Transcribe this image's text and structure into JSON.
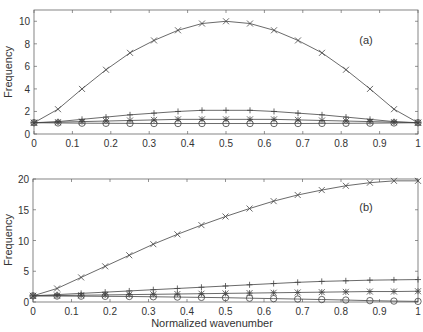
{
  "chart_data": [
    {
      "type": "line",
      "panel_label": "(a)",
      "xlabel": "",
      "ylabel": "Frequency",
      "xlim": [
        0,
        1
      ],
      "ylim": [
        0,
        11
      ],
      "xticks": [
        0,
        0.1,
        0.2,
        0.3,
        0.4,
        0.5,
        0.6,
        0.7,
        0.8,
        0.9,
        1
      ],
      "xtick_labels": [
        "0",
        "0.1",
        "0.2",
        "0.3",
        "0.4",
        "0.5",
        "0.6",
        "0.7",
        "0.8",
        "0.9",
        "1"
      ],
      "yticks": [
        0,
        2,
        4,
        6,
        8,
        10
      ],
      "ytick_labels": [
        "0",
        "2",
        "4",
        "6",
        "8",
        "10"
      ],
      "grid": false,
      "legend": "none",
      "x": [
        0,
        0.0625,
        0.125,
        0.1875,
        0.25,
        0.3125,
        0.375,
        0.4375,
        0.5,
        0.5625,
        0.625,
        0.6875,
        0.75,
        0.8125,
        0.875,
        0.9375,
        1.0
      ],
      "series": [
        {
          "name": "x-marker",
          "marker": "x",
          "values": [
            1.0,
            2.2,
            4.0,
            5.7,
            7.2,
            8.3,
            9.2,
            9.8,
            10.0,
            9.8,
            9.2,
            8.3,
            7.2,
            5.7,
            4.0,
            2.2,
            1.0
          ]
        },
        {
          "name": "plus-marker",
          "marker": "+",
          "values": [
            1.0,
            1.1,
            1.3,
            1.5,
            1.7,
            1.85,
            2.0,
            2.1,
            2.1,
            2.1,
            2.0,
            1.85,
            1.7,
            1.5,
            1.3,
            1.1,
            1.0
          ]
        },
        {
          "name": "star-marker",
          "marker": "*",
          "values": [
            1.0,
            1.05,
            1.1,
            1.15,
            1.2,
            1.25,
            1.3,
            1.3,
            1.3,
            1.3,
            1.3,
            1.25,
            1.2,
            1.15,
            1.1,
            1.05,
            1.0
          ]
        },
        {
          "name": "circle-marker",
          "marker": "o",
          "values": [
            1.0,
            0.98,
            0.96,
            0.95,
            0.94,
            0.93,
            0.93,
            0.93,
            0.93,
            0.93,
            0.93,
            0.93,
            0.94,
            0.95,
            0.96,
            0.98,
            1.0
          ]
        }
      ]
    },
    {
      "type": "line",
      "panel_label": "(b)",
      "xlabel": "Normalized wavenumber",
      "ylabel": "Frequency",
      "xlim": [
        0,
        1
      ],
      "ylim": [
        0,
        20
      ],
      "xticks": [
        0,
        0.1,
        0.2,
        0.3,
        0.4,
        0.5,
        0.6,
        0.7,
        0.8,
        0.9,
        1
      ],
      "xtick_labels": [
        "0",
        "0.1",
        "0.2",
        "0.3",
        "0.4",
        "0.5",
        "0.6",
        "0.7",
        "0.8",
        "0.9",
        "1"
      ],
      "yticks": [
        0,
        5,
        10,
        15,
        20
      ],
      "ytick_labels": [
        "0",
        "5",
        "10",
        "15",
        "20"
      ],
      "grid": false,
      "legend": "none",
      "x": [
        0,
        0.0625,
        0.125,
        0.1875,
        0.25,
        0.3125,
        0.375,
        0.4375,
        0.5,
        0.5625,
        0.625,
        0.6875,
        0.75,
        0.8125,
        0.875,
        0.9375,
        1.0
      ],
      "series": [
        {
          "name": "x-marker",
          "marker": "x",
          "values": [
            1.0,
            2.2,
            4.0,
            5.8,
            7.6,
            9.4,
            11.0,
            12.5,
            13.9,
            15.2,
            16.4,
            17.4,
            18.2,
            18.9,
            19.4,
            19.7,
            19.7
          ]
        },
        {
          "name": "plus-marker",
          "marker": "+",
          "values": [
            1.0,
            1.2,
            1.4,
            1.6,
            1.8,
            2.0,
            2.2,
            2.4,
            2.6,
            2.8,
            3.0,
            3.2,
            3.35,
            3.45,
            3.55,
            3.6,
            3.65
          ]
        },
        {
          "name": "star-marker",
          "marker": "*",
          "values": [
            1.0,
            1.05,
            1.1,
            1.15,
            1.2,
            1.25,
            1.3,
            1.35,
            1.4,
            1.45,
            1.5,
            1.55,
            1.6,
            1.65,
            1.7,
            1.7,
            1.75
          ]
        },
        {
          "name": "circle-marker",
          "marker": "o",
          "values": [
            1.0,
            0.97,
            0.95,
            0.92,
            0.9,
            0.85,
            0.8,
            0.75,
            0.7,
            0.62,
            0.55,
            0.48,
            0.4,
            0.32,
            0.22,
            0.15,
            0.1
          ]
        }
      ]
    }
  ],
  "panels": [
    {
      "label": "(a)",
      "ylabel": "Frequency"
    },
    {
      "label": "(b)",
      "ylabel": "Frequency",
      "xlabel": "Normalized wavenumber"
    }
  ]
}
